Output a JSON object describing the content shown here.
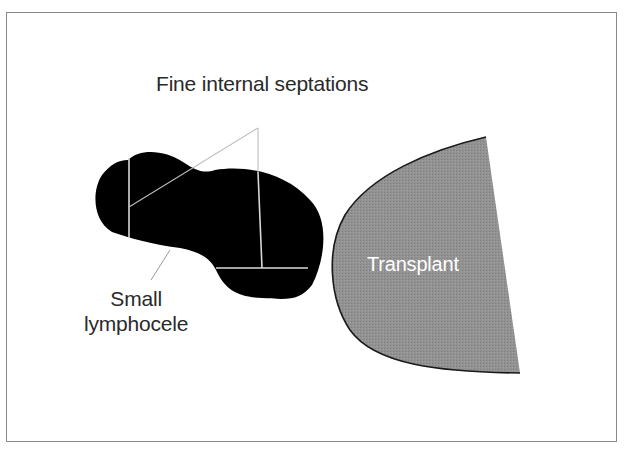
{
  "diagram": {
    "labels": {
      "septations": "Fine internal septations",
      "lymphocele_line1": "Small",
      "lymphocele_line2": "lymphocele",
      "transplant": "Transplant"
    },
    "colors": {
      "lymphocele_fill": "#000000",
      "septation_line": "#d8d8d8",
      "leader_line": "#9a9a9a",
      "transplant_fill": "#8f8f8f",
      "transplant_outline": "#1a1a1a",
      "frame_border": "#8a8a8a"
    }
  }
}
